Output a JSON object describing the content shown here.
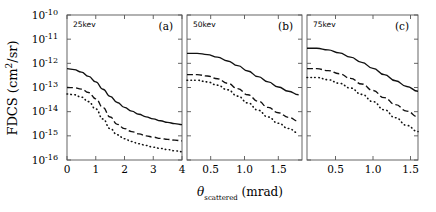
{
  "figure": {
    "ylabel_main": "FDCS",
    "ylabel_units": "(cm",
    "ylabel_exp": "2",
    "ylabel_units2": "/sr)",
    "xlabel_theta": "θ",
    "xlabel_sub": "scattered",
    "xlabel_units": "(mrad)"
  },
  "chart_data": {
    "type": "line",
    "title": "",
    "xlabel": "θ_scattered (mrad)",
    "ylabel": "FDCS (cm^2/sr)",
    "yscale": "log",
    "ylim": [
      1e-16,
      1e-10
    ],
    "ytick_labels": [
      "10^-16",
      "10^-15",
      "10^-14",
      "10^-13",
      "10^-12",
      "10^-11",
      "10^-10"
    ],
    "ytick_mant": [
      "10",
      "10",
      "10",
      "10",
      "10",
      "10",
      "10"
    ],
    "ytick_exp": [
      "-16",
      "-15",
      "-14",
      "-13",
      "-12",
      "-11",
      "-10"
    ],
    "grid": false,
    "legend": "none",
    "panels": [
      {
        "id": "(a)",
        "energy_label": "25kev",
        "xlim": [
          0,
          4
        ],
        "xticks": [
          0,
          1,
          2,
          3,
          4
        ],
        "xtick_labels": [
          "0",
          "1",
          "2",
          "3",
          "4"
        ],
        "series": [
          {
            "name": "solid",
            "style": "solid",
            "x": [
              0,
              0.25,
              0.5,
              0.75,
              1.0,
              1.25,
              1.5,
              1.75,
              2.0,
              2.25,
              2.5,
              2.75,
              3.0,
              3.25,
              3.5,
              3.75,
              4.0
            ],
            "y": [
              6e-13,
              5.5e-13,
              4.3e-13,
              2.9e-13,
              1.7e-13,
              8.5e-14,
              4.3e-14,
              2.4e-14,
              1.5e-14,
              1.05e-14,
              7.8e-15,
              6.1e-15,
              5e-15,
              4.2e-15,
              3.6e-15,
              3.2e-15,
              2.9e-15
            ]
          },
          {
            "name": "dashed",
            "style": "dashed",
            "x": [
              0,
              0.25,
              0.5,
              0.75,
              1.0,
              1.25,
              1.5,
              1.75,
              2.0,
              2.25,
              2.5,
              2.75,
              3.0,
              3.25,
              3.5,
              3.75,
              4.0
            ],
            "y": [
              1e-13,
              9.8e-14,
              8.6e-14,
              6.2e-14,
              3.4e-14,
              1.5e-14,
              6e-15,
              3e-15,
              2e-15,
              1.5e-15,
              1.2e-15,
              1e-15,
              8.8e-16,
              7.8e-16,
              7.1e-16,
              6.6e-16,
              6.2e-16
            ]
          },
          {
            "name": "dotted",
            "style": "dotted",
            "x": [
              0,
              0.25,
              0.5,
              0.75,
              1.0,
              1.25,
              1.5,
              1.75,
              2.0,
              2.25,
              2.5,
              2.75,
              3.0,
              3.25,
              3.5,
              3.75,
              4.0
            ],
            "y": [
              5.4e-14,
              5e-14,
              4e-14,
              2.6e-14,
              1.3e-14,
              5e-15,
              2e-15,
              1.1e-15,
              7.6e-16,
              5.8e-16,
              4.7e-16,
              4e-16,
              3.4e-16,
              3e-16,
              2.7e-16,
              2.4e-16,
              2.2e-16
            ]
          }
        ]
      },
      {
        "id": "(b)",
        "energy_label": "50kev",
        "xlim": [
          0.15,
          1.85
        ],
        "xticks": [
          0.5,
          1.0,
          1.5
        ],
        "xtick_labels": [
          "0.5",
          "1.0",
          "1.5"
        ],
        "series": [
          {
            "name": "solid",
            "style": "solid",
            "x": [
              0.15,
              0.3,
              0.45,
              0.6,
              0.75,
              0.9,
              1.05,
              1.2,
              1.35,
              1.5,
              1.65,
              1.8
            ],
            "y": [
              2.6e-12,
              2.6e-12,
              2.3e-12,
              1.8e-12,
              1.25e-12,
              8e-13,
              4.8e-13,
              2.8e-13,
              1.7e-13,
              1.05e-13,
              7e-14,
              5e-14
            ]
          },
          {
            "name": "dashed",
            "style": "dashed",
            "x": [
              0.15,
              0.3,
              0.45,
              0.6,
              0.75,
              0.9,
              1.05,
              1.2,
              1.35,
              1.5,
              1.65,
              1.8
            ],
            "y": [
              3.4e-13,
              3.4e-13,
              3e-13,
              2.3e-13,
              1.5e-13,
              9e-14,
              5e-14,
              2.7e-14,
              1.5e-14,
              9e-15,
              5.8e-15,
              4e-15
            ]
          },
          {
            "name": "dotted",
            "style": "dotted",
            "x": [
              0.15,
              0.3,
              0.45,
              0.6,
              0.75,
              0.9,
              1.05,
              1.2,
              1.35,
              1.5,
              1.65,
              1.8
            ],
            "y": [
              2e-13,
              2e-13,
              1.7e-13,
              1.25e-13,
              8e-14,
              4.4e-14,
              2.3e-14,
              1.15e-14,
              6e-15,
              3.3e-15,
              2e-15,
              1.3e-15
            ]
          }
        ]
      },
      {
        "id": "(c)",
        "energy_label": "75kev",
        "xlim": [
          0.12,
          1.6
        ],
        "xticks": [
          0.5,
          1.0,
          1.5
        ],
        "xtick_labels": [
          "0.5",
          "1.0",
          "1.5"
        ],
        "series": [
          {
            "name": "solid",
            "style": "solid",
            "x": [
              0.12,
              0.25,
              0.4,
              0.55,
              0.7,
              0.85,
              1.0,
              1.15,
              1.3,
              1.45,
              1.6
            ],
            "y": [
              4.2e-12,
              4.2e-12,
              3.6e-12,
              2.7e-12,
              1.8e-12,
              1.1e-12,
              6.2e-13,
              3.4e-13,
              1.9e-13,
              1.1e-13,
              7e-14
            ]
          },
          {
            "name": "dashed",
            "style": "dashed",
            "x": [
              0.12,
              0.25,
              0.4,
              0.55,
              0.7,
              0.85,
              1.0,
              1.15,
              1.3,
              1.45,
              1.6
            ],
            "y": [
              6e-13,
              6e-13,
              5e-13,
              3.7e-13,
              2.4e-13,
              1.4e-13,
              7.5e-14,
              3.8e-14,
              1.95e-14,
              1.05e-14,
              6.2e-15
            ]
          },
          {
            "name": "dotted",
            "style": "dotted",
            "x": [
              0.12,
              0.25,
              0.4,
              0.55,
              0.7,
              0.85,
              1.0,
              1.15,
              1.3,
              1.45,
              1.6
            ],
            "y": [
              2.6e-13,
              2.6e-13,
              2.1e-13,
              1.5e-13,
              9.5e-14,
              5.2e-14,
              2.6e-14,
              1.2e-14,
              5.6e-15,
              2.7e-15,
              1.5e-15
            ]
          }
        ]
      }
    ]
  }
}
